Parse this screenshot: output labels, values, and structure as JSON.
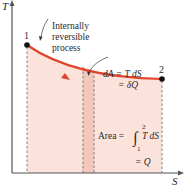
{
  "axes": {
    "y_label": "T",
    "x_label": "S"
  },
  "points": {
    "start_label": "1",
    "end_label": "2"
  },
  "process_label": {
    "line1": "Internally",
    "line2": "reversible",
    "line3": "process"
  },
  "differential_label": {
    "line1": "dA = T dS",
    "line2": "= δQ"
  },
  "area_label": {
    "prefix": "Area =",
    "integral": "∫",
    "upper": "2",
    "lower": "1",
    "integrand": "T dS",
    "line2": "= Q"
  },
  "colors": {
    "curve": "#e0452b",
    "area_fill": "#fbe3dc",
    "strip_fill": "#f3c7bb",
    "axis": "#555555",
    "dash": "#666666",
    "point": "#111111"
  }
}
